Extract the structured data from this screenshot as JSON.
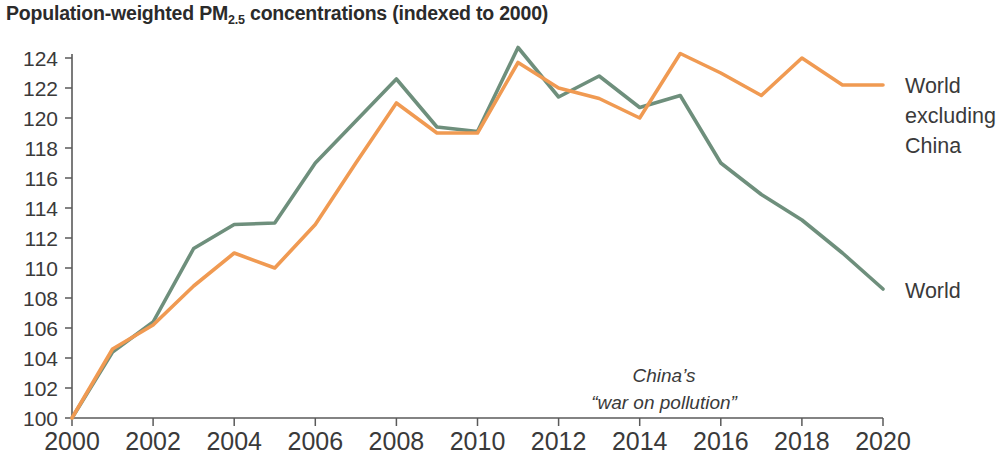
{
  "chart_data": {
    "type": "line",
    "title": "Population-weighted PM2.5 concentrations (indexed to 2000)",
    "title_parts": {
      "before_sub": "Population-weighted PM",
      "sub": "2.5",
      "after_sub": " concentrations (indexed to 2000)"
    },
    "xlabel": "",
    "ylabel": "",
    "x": [
      2000,
      2001,
      2002,
      2003,
      2004,
      2005,
      2006,
      2007,
      2008,
      2009,
      2010,
      2011,
      2012,
      2013,
      2014,
      2015,
      2016,
      2017,
      2018,
      2019,
      2020
    ],
    "xlim": [
      2000,
      2020
    ],
    "ylim": [
      100,
      124
    ],
    "x_ticks": [
      2000,
      2002,
      2004,
      2006,
      2008,
      2010,
      2012,
      2014,
      2016,
      2018,
      2020
    ],
    "x_tick_labels": [
      "2000",
      "2002",
      "2004",
      "2006",
      "2008",
      "2010",
      "2012",
      "2014",
      "2016",
      "2018",
      "2020"
    ],
    "y_ticks": [
      100,
      102,
      104,
      106,
      108,
      110,
      112,
      114,
      116,
      118,
      120,
      122,
      124
    ],
    "y_tick_labels": [
      "100",
      "102",
      "104",
      "106",
      "108",
      "110",
      "112",
      "114",
      "116",
      "118",
      "120",
      "122",
      "124"
    ],
    "grid": false,
    "legend": "right-inline-labels",
    "series": [
      {
        "name": "World",
        "color": "#6E8F7C",
        "values": [
          100.0,
          104.4,
          106.4,
          111.3,
          112.9,
          113.0,
          117.0,
          119.8,
          122.6,
          119.4,
          119.1,
          124.7,
          121.4,
          122.8,
          120.7,
          121.5,
          117.0,
          114.9,
          113.2,
          111.0,
          108.6
        ]
      },
      {
        "name": "World excluding China",
        "color": "#F09A52",
        "values": [
          100.0,
          104.6,
          106.2,
          108.8,
          111.0,
          110.0,
          112.9,
          117.0,
          121.0,
          119.0,
          119.0,
          123.7,
          122.0,
          121.3,
          120.0,
          124.3,
          123.0,
          121.5,
          124.0,
          122.2,
          122.2
        ]
      }
    ],
    "annotations": [
      {
        "text_line1": "China’s",
        "text_line2": "“war on pollution”",
        "x": 2014.6,
        "y": 102.4
      }
    ],
    "series_labels": [
      {
        "name": "World excluding China",
        "lines": [
          "World",
          "excluding",
          "China"
        ]
      },
      {
        "name": "World",
        "lines": [
          "World"
        ]
      }
    ]
  }
}
